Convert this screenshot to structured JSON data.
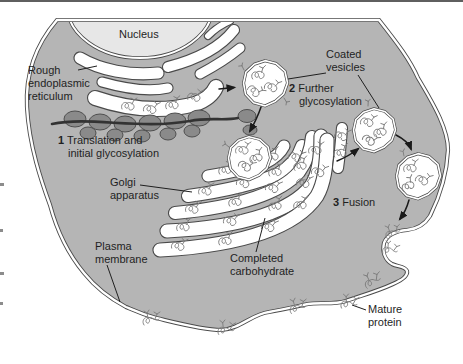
{
  "labels": {
    "nucleus": "Nucleus",
    "rough_er": [
      "Rough",
      "endoplasmic",
      "reticulum"
    ],
    "step1": {
      "num": "1",
      "lines": [
        "Translation and",
        "initial glycosylation"
      ]
    },
    "coated_vesicles": [
      "Coated",
      "vesicles"
    ],
    "step2": {
      "num": "2",
      "lines": [
        "Further",
        "glycosylation"
      ]
    },
    "golgi": [
      "Golgi",
      "apparatus"
    ],
    "plasma_membrane": [
      "Plasma",
      "membrane"
    ],
    "completed_carbohydrate": [
      "Completed",
      "carbohydrate"
    ],
    "step3": {
      "num": "3",
      "text": "Fusion"
    },
    "mature_protein": [
      "Mature",
      "protein"
    ]
  },
  "colors": {
    "background": "#ffffff",
    "cytoplasm": "#b5b5b5",
    "nucleus_fill": "#e7e7e7",
    "organelle_fill": "#ffffff",
    "membrane_gap": "#ffffff",
    "outline": "#4a4a4a",
    "ribosome_fill": "#8a8a8a",
    "ribosome_outline": "#4f4f4f",
    "mrna": "#333333",
    "squiggle": "#7d7d7d",
    "arrow": "#1a1a1a",
    "text": "#1f1f1f"
  }
}
